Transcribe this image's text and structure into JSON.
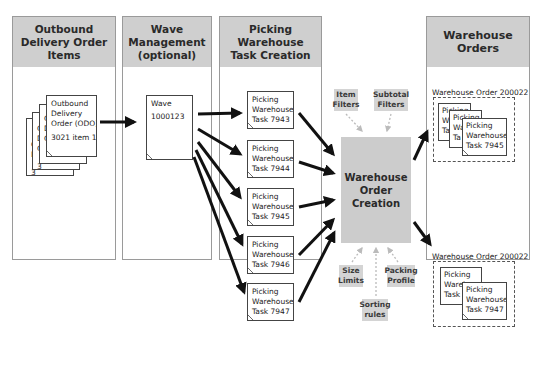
{
  "columns": [
    {
      "id": "odo",
      "title": "Outbound Delivery Order Items"
    },
    {
      "id": "wave",
      "title": "Wave Management (optional)"
    },
    {
      "id": "pwt",
      "title": "Picking Warehouse Task Creation"
    },
    {
      "id": "wo",
      "title": "Warehouse Orders"
    }
  ],
  "odo_doc": {
    "line1": "Outbound",
    "line2": "Delivery",
    "line3": "Order (ODO)",
    "line4": "3021 item 10",
    "stack_hint_chars": [
      "O",
      "D",
      "O",
      "3"
    ]
  },
  "wave_doc": {
    "line1": "Wave",
    "line2": "1000123"
  },
  "tasks": [
    {
      "l1": "Picking",
      "l2": "Warehouse",
      "l3": "Task 7943"
    },
    {
      "l1": "Picking",
      "l2": "Warehouse",
      "l3": "Task 7944"
    },
    {
      "l1": "Picking",
      "l2": "Warehouse",
      "l3": "Task 7945"
    },
    {
      "l1": "Picking",
      "l2": "Warehouse",
      "l3": "Task 7946"
    },
    {
      "l1": "Picking",
      "l2": "Warehouse",
      "l3": "Task 7947"
    }
  ],
  "woc": {
    "title": "Warehouse Order Creation"
  },
  "inputs": {
    "item_filters": "Item Filters",
    "subtotal_filters": "Subtotal Filters",
    "size_limits": "Size Limits",
    "packing_profile": "Packing Profile",
    "sorting_rules": "Sorting rules"
  },
  "warehouse_orders": [
    {
      "label": "Warehouse Order 200022",
      "tasks": [
        {
          "l1": "Picking",
          "l2": "Wa",
          "l3": "Ta"
        },
        {
          "l1": "Picking",
          "l2": "Wa",
          "l3": "Ta"
        },
        {
          "l1": "Picking",
          "l2": "Warehouse",
          "l3": "Task 7945"
        }
      ]
    },
    {
      "label": "Warehouse Order 200022",
      "tasks": [
        {
          "l1": "Picking",
          "l2": "Warehouse",
          "l3": "Task 7"
        },
        {
          "l1": "Picking",
          "l2": "Warehouse",
          "l3": "Task 7947"
        }
      ]
    }
  ],
  "colors": {
    "header_bg": "#cfcfcf",
    "woc_bg": "#cccccc",
    "input_bg": "#d4d4d4",
    "arrow": "#111111",
    "dotted_arrow": "#bbbbbb"
  }
}
